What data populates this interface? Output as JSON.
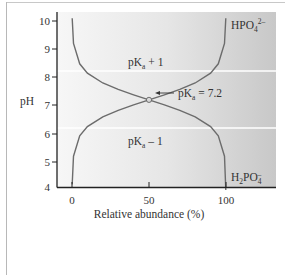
{
  "chart_data": {
    "type": "line",
    "title": "",
    "xlabel": "Relative abundance (%)",
    "ylabel": "pH",
    "xlim": [
      0,
      100
    ],
    "ylim": [
      4,
      10
    ],
    "x_ticks": [
      "0",
      "50",
      "100"
    ],
    "y_ticks": [
      "4",
      "5",
      "6",
      "7",
      "8",
      "9",
      "10"
    ],
    "grid": false,
    "pKa": 7.2,
    "bands": [
      {
        "label_main": "pK",
        "label_sub": "a",
        "label_rest": " + 1",
        "ph": 8.2
      },
      {
        "label_main": "pK",
        "label_sub": "a",
        "label_rest": " – 1",
        "ph": 6.2
      }
    ],
    "annotation": {
      "main": "pK",
      "sub": "a",
      "rest": " = 7.2",
      "x": 50,
      "y": 7.2
    },
    "series": [
      {
        "name": "HPO4 2-",
        "label_main": "HPO",
        "label_sub": "4",
        "label_sup": "2–",
        "description": "Relative abundance of HPO4^2- vs pH (increases with pH)",
        "x": [
          0.1,
          1,
          5,
          10,
          20,
          30,
          40,
          50,
          60,
          70,
          80,
          90,
          95,
          99,
          99.9
        ],
        "y": [
          4.2,
          5.2,
          5.92,
          6.25,
          6.6,
          6.83,
          7.02,
          7.2,
          7.38,
          7.57,
          7.8,
          8.15,
          8.48,
          9.2,
          10.1
        ]
      },
      {
        "name": "H2PO4-",
        "label_main": "H",
        "label_sub": "2",
        "label_main2": "PO",
        "label_sub2": "4",
        "label_sup2": "–",
        "description": "Relative abundance of H2PO4- vs pH (decreases with pH)",
        "x": [
          0.1,
          1,
          5,
          10,
          20,
          30,
          40,
          50,
          60,
          70,
          80,
          90,
          95,
          99,
          99.9
        ],
        "y": [
          10.1,
          9.2,
          8.48,
          8.15,
          7.8,
          7.57,
          7.38,
          7.2,
          7.02,
          6.83,
          6.6,
          6.25,
          5.92,
          5.2,
          4.0
        ]
      }
    ],
    "colors": {
      "curve": "#707070",
      "axis": "#222222",
      "band_line": "#ffffff",
      "bg_left": "#f6f6f6",
      "bg_right": "#c9c9c9"
    }
  }
}
